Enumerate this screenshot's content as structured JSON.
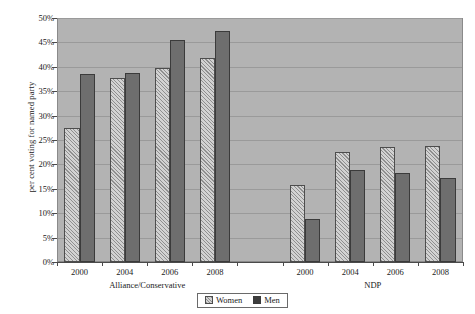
{
  "chart_data": {
    "type": "bar",
    "title": "",
    "xlabel": "",
    "ylabel": "per cent voting for named party",
    "ylim": [
      0,
      50
    ],
    "ytick_labels": [
      "0%",
      "5%",
      "10%",
      "15%",
      "20%",
      "25%",
      "30%",
      "35%",
      "40%",
      "45%",
      "50%"
    ],
    "ytick_values": [
      0,
      5,
      10,
      15,
      20,
      25,
      30,
      35,
      40,
      45,
      50
    ],
    "grid": true,
    "legend_position": "bottom-center",
    "categories": [
      "2000",
      "2004",
      "2006",
      "2008",
      "",
      "2000",
      "2004",
      "2006",
      "2008"
    ],
    "groups": [
      {
        "label": "Alliance/Conservative",
        "categories": [
          "2000",
          "2004",
          "2006",
          "2008"
        ]
      },
      {
        "label": "NDP",
        "categories": [
          "2000",
          "2004",
          "2006",
          "2008"
        ]
      }
    ],
    "series": [
      {
        "name": "Women",
        "values": [
          27.5,
          37.7,
          39.8,
          41.8,
          null,
          15.8,
          22.5,
          23.5,
          23.8
        ]
      },
      {
        "name": "Men",
        "values": [
          38.5,
          38.8,
          45.4,
          47.3,
          null,
          8.8,
          18.8,
          18.2,
          17.3
        ]
      }
    ]
  },
  "legend": {
    "entries": [
      {
        "label": "Women",
        "swatch": "hatched-light"
      },
      {
        "label": "Men",
        "swatch": "solid-dark"
      }
    ]
  },
  "colors": {
    "plot_background": "#b3b3b3",
    "gridline": "#9a9a9a",
    "women_fill": "#d2d2d2",
    "men_fill": "#6e6e6e",
    "axis": "#4a4a4a",
    "text": "#1a1a1a"
  }
}
